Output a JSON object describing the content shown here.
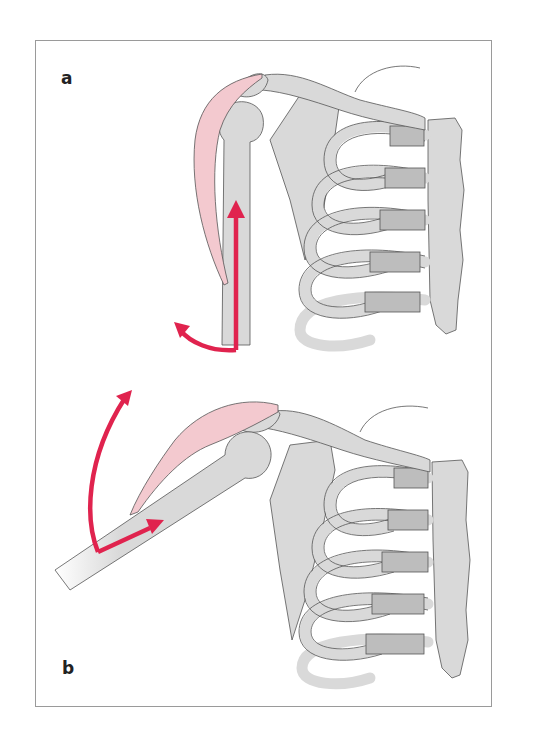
{
  "figure": {
    "panels": [
      {
        "label": "a",
        "description": "Arm hanging at side; deltoid muscle (pink) with upward and outward arrows at humerus"
      },
      {
        "label": "b",
        "description": "Arm abducted; deltoid muscle (pink) with arrows showing rotation upward"
      }
    ],
    "colors": {
      "bone": "#d9d9d9",
      "cartilage": "#bdbdbd",
      "outline": "#555555",
      "muscle": "#f3c9cf",
      "arrow": "#e0234e",
      "frame": "#9a9a9a"
    }
  }
}
